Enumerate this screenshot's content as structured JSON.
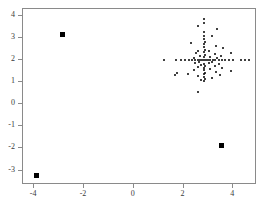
{
  "chart_data": {
    "type": "scatter",
    "title": "",
    "xlabel": "",
    "ylabel": "",
    "xlim": [
      -4.45,
      4.95
    ],
    "ylim": [
      -3.65,
      4.3
    ],
    "xticks": [
      -4,
      -2,
      0,
      2,
      4
    ],
    "xticklabels": [
      "-4",
      "-2",
      "0",
      "2",
      "4"
    ],
    "yticks": [
      -3,
      -2,
      -1,
      0,
      1,
      2,
      3,
      4
    ],
    "yticklabels": [
      "-3",
      "-2",
      "-1",
      "0",
      "1",
      "2",
      "3",
      "4"
    ],
    "grid": false,
    "legend": null,
    "marker": "filled-circle",
    "marker_color": "#000000",
    "series": [
      {
        "name": "main-cluster",
        "marker_size": 2,
        "points": [
          [
            2.87,
            3.8
          ],
          [
            2.85,
            3.62
          ],
          [
            2.63,
            3.5
          ],
          [
            3.4,
            3.33
          ],
          [
            2.88,
            3.2
          ],
          [
            2.86,
            3.05
          ],
          [
            3.2,
            3.02
          ],
          [
            2.87,
            2.9
          ],
          [
            2.9,
            2.78
          ],
          [
            2.33,
            2.72
          ],
          [
            2.88,
            2.66
          ],
          [
            3.35,
            2.6
          ],
          [
            2.86,
            2.52
          ],
          [
            3.62,
            2.5
          ],
          [
            2.9,
            2.42
          ],
          [
            2.6,
            2.38
          ],
          [
            3.05,
            2.36
          ],
          [
            2.88,
            2.3
          ],
          [
            3.95,
            2.28
          ],
          [
            2.55,
            2.25
          ],
          [
            3.3,
            2.22
          ],
          [
            2.9,
            2.18
          ],
          [
            3.55,
            2.15
          ],
          [
            2.72,
            2.12
          ],
          [
            3.1,
            2.1
          ],
          [
            2.86,
            2.07
          ],
          [
            2.45,
            2.05
          ],
          [
            3.4,
            2.04
          ],
          [
            1.25,
            1.97
          ],
          [
            1.72,
            1.96
          ],
          [
            1.95,
            1.96
          ],
          [
            2.1,
            1.96
          ],
          [
            2.25,
            1.96
          ],
          [
            2.38,
            1.96
          ],
          [
            2.5,
            1.95
          ],
          [
            2.62,
            1.95
          ],
          [
            2.72,
            1.95
          ],
          [
            2.8,
            1.95
          ],
          [
            2.88,
            1.95
          ],
          [
            2.95,
            1.95
          ],
          [
            3.02,
            1.95
          ],
          [
            3.12,
            1.95
          ],
          [
            3.22,
            1.95
          ],
          [
            3.32,
            1.95
          ],
          [
            3.45,
            1.95
          ],
          [
            3.58,
            1.95
          ],
          [
            3.72,
            1.95
          ],
          [
            3.88,
            1.95
          ],
          [
            4.02,
            1.95
          ],
          [
            4.35,
            1.94
          ],
          [
            4.5,
            1.94
          ],
          [
            4.68,
            1.94
          ],
          [
            2.65,
            1.88
          ],
          [
            3.18,
            1.86
          ],
          [
            2.5,
            1.82
          ],
          [
            3.05,
            1.8
          ],
          [
            2.86,
            1.78
          ],
          [
            3.45,
            1.76
          ],
          [
            2.75,
            1.72
          ],
          [
            3.3,
            1.7
          ],
          [
            2.9,
            1.66
          ],
          [
            2.6,
            1.62
          ],
          [
            3.6,
            1.6
          ],
          [
            2.88,
            1.58
          ],
          [
            3.12,
            1.54
          ],
          [
            2.45,
            1.5
          ],
          [
            2.86,
            1.48
          ],
          [
            3.95,
            1.46
          ],
          [
            3.35,
            1.42
          ],
          [
            2.9,
            1.38
          ],
          [
            1.78,
            1.36
          ],
          [
            2.2,
            1.34
          ],
          [
            2.88,
            1.3
          ],
          [
            3.5,
            1.28
          ],
          [
            2.62,
            1.24
          ],
          [
            2.86,
            1.2
          ],
          [
            3.18,
            1.16
          ],
          [
            2.9,
            1.1
          ],
          [
            2.75,
            1.05
          ],
          [
            1.7,
            1.28
          ],
          [
            2.88,
            0.98
          ],
          [
            2.6,
            0.52
          ]
        ]
      },
      {
        "name": "outliers",
        "marker": "filled-square",
        "marker_size": 5,
        "points": [
          [
            -2.82,
            3.12
          ],
          [
            -3.86,
            -3.28
          ],
          [
            3.58,
            -1.93
          ]
        ]
      }
    ]
  },
  "axes": {
    "frame_color": "#8a8a8a",
    "label_color": "#3a3a3a",
    "background": "#ffffff"
  }
}
